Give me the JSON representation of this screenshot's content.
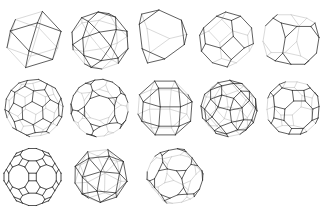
{
  "figure": {
    "background": "#ffffff",
    "front_edge_color": "#2b2b2b",
    "back_edge_color": "#c8c8c8",
    "layout": {
      "rows": 3,
      "columns": 5,
      "count": 13
    }
  },
  "solids": [
    {
      "name": "cuboctahedron",
      "row": 0,
      "col": 0,
      "box": [
        7,
        11,
        54,
        57
      ],
      "rot": [
        0.35,
        0.45,
        0.55
      ]
    },
    {
      "name": "icosidodecahedron",
      "row": 0,
      "col": 1,
      "box": [
        72,
        12,
        56,
        57
      ],
      "rot": [
        0.25,
        0.35,
        0.15
      ]
    },
    {
      "name": "truncated tetrahedron",
      "row": 0,
      "col": 2,
      "box": [
        137,
        10,
        52,
        53
      ],
      "rot": [
        0.62,
        0.78,
        0.0
      ]
    },
    {
      "name": "truncated octahedron",
      "row": 0,
      "col": 3,
      "box": [
        198,
        12,
        57,
        55
      ],
      "rot": [
        0.35,
        0.25,
        0.0
      ]
    },
    {
      "name": "truncated cube",
      "row": 0,
      "col": 4,
      "box": [
        263,
        12,
        56,
        55
      ],
      "rot": [
        0.3,
        0.55,
        0.0
      ]
    },
    {
      "name": "truncated icosahedron",
      "row": 1,
      "col": 0,
      "box": [
        5,
        78,
        58,
        60
      ],
      "rot": [
        0.2,
        0.3,
        0.1
      ]
    },
    {
      "name": "truncated dodecahedron",
      "row": 1,
      "col": 1,
      "box": [
        71,
        78,
        57,
        60
      ],
      "rot": [
        0.15,
        0.55,
        0.1
      ]
    },
    {
      "name": "rhombicuboctahedron",
      "row": 1,
      "col": 2,
      "box": [
        138,
        78,
        54,
        60
      ],
      "rot": [
        0.35,
        0.2,
        0.0
      ]
    },
    {
      "name": "rhombicosidodecahedron",
      "row": 1,
      "col": 3,
      "box": [
        201,
        78,
        56,
        61
      ],
      "rot": [
        0.3,
        0.25,
        0.2
      ]
    },
    {
      "name": "truncated cuboctahedron",
      "row": 1,
      "col": 4,
      "box": [
        267,
        78,
        52,
        60
      ],
      "rot": [
        0.3,
        0.25,
        0.0
      ]
    },
    {
      "name": "truncated icosidodecahedron",
      "row": 2,
      "col": 0,
      "box": [
        4,
        148,
        57,
        58
      ],
      "rot": [
        0.0,
        0.0,
        0.0
      ]
    },
    {
      "name": "snub cube",
      "row": 2,
      "col": 1,
      "box": [
        75,
        147,
        52,
        58
      ],
      "rot": [
        0.35,
        0.3,
        0.2
      ]
    },
    {
      "name": "snub dodecahedron",
      "row": 2,
      "col": 2,
      "box": [
        147,
        147,
        56,
        58
      ],
      "rot": [
        0.3,
        0.25,
        0.15
      ]
    }
  ]
}
